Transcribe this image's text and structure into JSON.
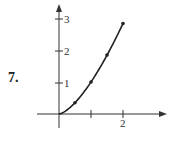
{
  "problem_number": "7.",
  "chart_data": {
    "type": "line",
    "title": "",
    "xlabel": "",
    "ylabel": "",
    "function": "y = x^(3/2)",
    "x": [
      0,
      0.5,
      1,
      1.5,
      2
    ],
    "values": [
      0,
      0.35,
      1,
      1.84,
      2.83
    ],
    "marked_points": [
      [
        0.5,
        0.35
      ],
      [
        1,
        1
      ],
      [
        1.5,
        1.84
      ],
      [
        2,
        2.83
      ]
    ],
    "xlim": [
      -0.7,
      3.3
    ],
    "ylim": [
      -0.45,
      3.4
    ],
    "x_ticks": [
      1,
      2
    ],
    "x_tick_labels": [
      "",
      "2"
    ],
    "y_ticks": [
      1,
      2,
      3
    ],
    "y_tick_labels": [
      "1",
      "2",
      "3"
    ],
    "grid": false,
    "legend": "none",
    "colors": {
      "curve": "#222222",
      "axes": "#333333"
    }
  }
}
